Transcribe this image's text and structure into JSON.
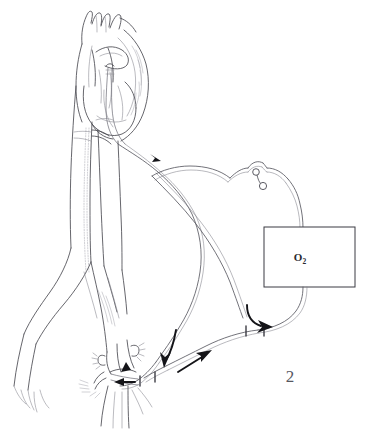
{
  "figure": {
    "domain": "Diagram",
    "number_label": "2",
    "background_color": "#ffffff",
    "ink_color": "#4a4a52",
    "arrow_color": "#141418"
  },
  "oxygenator": {
    "label_main": "O",
    "label_sub": "2",
    "name": "oxygenator-unit",
    "border_color": "#3a3a42",
    "fill_color": "#ffffff"
  },
  "anatomy": {
    "heart": "heart-with-aortic-arch",
    "arch_vessels": "brachiocephalic-branch-vessels",
    "descending_aorta": "descending-aorta",
    "vena_cava": "inferior-vena-cava",
    "bifurcation": "iliac-bifurcation",
    "femoral_site": "femoral-cannulation-site"
  },
  "circuit": {
    "inflow_tube": "venous-drainage-tube",
    "outflow_tube": "arterial-return-tube",
    "clamp": "tubing-clamp-assembly",
    "connector": "tube-connector"
  },
  "arrows": [
    {
      "name": "flow-arrow-upper-aortic",
      "direction": "down-right"
    },
    {
      "name": "flow-arrow-oxygenator-outlet",
      "direction": "right"
    },
    {
      "name": "flow-arrow-femoral-down",
      "direction": "down-left"
    },
    {
      "name": "flow-arrow-femoral-return",
      "direction": "up-right"
    },
    {
      "name": "flow-arrow-femoral-inner",
      "direction": "left"
    }
  ]
}
